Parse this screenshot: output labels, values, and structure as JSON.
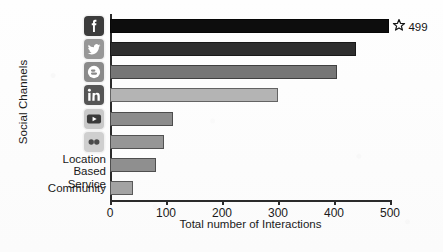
{
  "chart_data": {
    "type": "bar",
    "orientation": "horizontal",
    "title": "",
    "xlabel": "Total number of Interactions",
    "ylabel": "Social Channels",
    "xlim": [
      0,
      500
    ],
    "ylim": [
      0,
      8
    ],
    "grid": false,
    "legend": null,
    "xticks": [
      0,
      100,
      200,
      300,
      400,
      500
    ],
    "xticklabels": [
      "0",
      "100",
      "200",
      "300",
      "400",
      "500"
    ],
    "categories": [
      "Facebook",
      "Twitter",
      "Blogger",
      "LinkedIn",
      "YouTube",
      "Flickr",
      "Location\nBased Service",
      "Community"
    ],
    "values": [
      499,
      440,
      405,
      300,
      113,
      96,
      82,
      41
    ],
    "bar_colors": [
      "#0d0d0d",
      "#2e2e2e",
      "#767676",
      "#b4b4b4",
      "#8c8c8c",
      "#969696",
      "#8f8f8f",
      "#a3a3a3"
    ],
    "annotations": [
      {
        "target_category": "Facebook",
        "icon": "star-icon",
        "value": "499"
      }
    ]
  },
  "axis": {
    "ylabel_text": "Social Channels",
    "xlabel_text": "Total number of Interactions"
  },
  "categories": [
    {
      "label": "Facebook",
      "label_kind": "icon",
      "icon": "facebook-icon",
      "icon_bg": "#3c3c3c",
      "glyph_color": "#ffffff"
    },
    {
      "label": "Twitter",
      "label_kind": "icon",
      "icon": "twitter-icon",
      "icon_bg": "#979797",
      "glyph_color": "#ffffff"
    },
    {
      "label": "Blogger",
      "label_kind": "icon",
      "icon": "blogger-icon",
      "icon_bg": "#8a8a8a",
      "glyph_color": "#ffffff"
    },
    {
      "label": "LinkedIn",
      "label_kind": "icon",
      "icon": "linkedin-icon",
      "icon_bg": "#555555",
      "glyph_color": "#ffffff"
    },
    {
      "label": "YouTube",
      "label_kind": "icon",
      "icon": "youtube-icon",
      "icon_bg": "#c9c9c9",
      "glyph_color": "#3a3a3a"
    },
    {
      "label": "Flickr",
      "label_kind": "icon",
      "icon": "flickr-icon",
      "icon_bg": "#cfcfcf",
      "glyph_color": "#4a4a4a"
    },
    {
      "label": "Location\nBased Service",
      "label_kind": "text",
      "icon": null,
      "icon_bg": null,
      "glyph_color": null
    },
    {
      "label": "Community",
      "label_kind": "text",
      "icon": null,
      "icon_bg": null,
      "glyph_color": null
    }
  ],
  "annotation": {
    "icon_name": "star-icon",
    "value": "499"
  }
}
